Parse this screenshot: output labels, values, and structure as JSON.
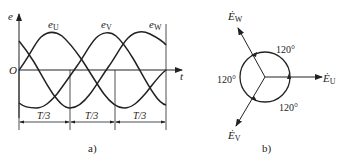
{
  "figure_a": {
    "y_axis_label": "e",
    "x_axis_label": "t",
    "origin_label": "O",
    "curves": [
      {
        "name": "e_U",
        "label_main": "e",
        "label_sub": "U"
      },
      {
        "name": "e_V",
        "label_main": "e",
        "label_sub": "V"
      },
      {
        "name": "e_W",
        "label_main": "e",
        "label_sub": "W"
      }
    ],
    "intervals": [
      "T/3",
      "T/3",
      "T/3"
    ],
    "caption": "a)"
  },
  "figure_b": {
    "phasors": [
      {
        "name": "E_U",
        "label_main": "Ė",
        "label_sub": "U",
        "angle_deg": 0
      },
      {
        "name": "E_V",
        "label_main": "Ė",
        "label_sub": "V",
        "angle_deg": -120
      },
      {
        "name": "E_W",
        "label_main": "Ė",
        "label_sub": "W",
        "angle_deg": 120
      }
    ],
    "angles": [
      "120°",
      "120°",
      "120°"
    ],
    "caption": "b)"
  }
}
